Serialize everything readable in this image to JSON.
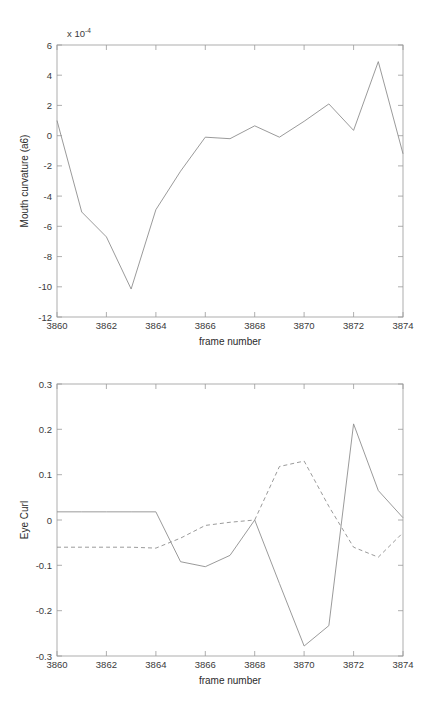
{
  "figure": {
    "background_color": "#ffffff",
    "axis_color": "#9a9a9a",
    "line_color": "#8e8e8e",
    "text_color": "#3a3a3a"
  },
  "chart_data": [
    {
      "id": "mouth-curvature",
      "type": "line",
      "title": "",
      "xlabel": "frame number",
      "ylabel": "Mouth curvature (a6)",
      "y_exponent_label": "x 10",
      "y_exponent_power": "-4",
      "y_scale_factor": 0.0001,
      "xlim": [
        3860,
        3874
      ],
      "ylim": [
        -12,
        6
      ],
      "xticks": [
        3860,
        3862,
        3864,
        3866,
        3868,
        3870,
        3872,
        3874
      ],
      "xticklabels": [
        "3860",
        "3862",
        "3864",
        "3866",
        "3868",
        "3870",
        "3872",
        "3874"
      ],
      "x_minor_ticks": [
        3861,
        3863,
        3865,
        3867,
        3869,
        3871,
        3873
      ],
      "yticks": [
        6,
        4,
        2,
        0,
        -2,
        -4,
        -6,
        -8,
        -10,
        -12
      ],
      "yticklabels": [
        "6",
        "4",
        "2",
        "0",
        "-2",
        "-4",
        "-6",
        "-8",
        "-10",
        "-12"
      ],
      "grid": false,
      "legend": false,
      "x": [
        3860,
        3861,
        3862,
        3863,
        3864,
        3865,
        3866,
        3867,
        3868,
        3869,
        3870,
        3871,
        3872,
        3873,
        3874
      ],
      "series": [
        {
          "name": "mouth curvature",
          "style": "solid",
          "values": [
            1.0,
            -5.05,
            -6.7,
            -10.15,
            -4.9,
            -2.35,
            -0.1,
            -0.2,
            0.65,
            -0.1,
            0.95,
            2.1,
            0.35,
            4.9,
            -1.2
          ]
        }
      ]
    },
    {
      "id": "eye-curl",
      "type": "line",
      "title": "",
      "xlabel": "frame number",
      "ylabel": "Eye Curl",
      "xlim": [
        3860,
        3874
      ],
      "ylim": [
        -0.3,
        0.3
      ],
      "xticks": [
        3860,
        3862,
        3864,
        3866,
        3868,
        3870,
        3872,
        3874
      ],
      "xticklabels": [
        "3860",
        "3862",
        "3864",
        "3866",
        "3868",
        "3870",
        "3872",
        "3874"
      ],
      "x_minor_ticks": [
        3861,
        3863,
        3865,
        3867,
        3869,
        3871,
        3873
      ],
      "yticks": [
        0.3,
        0.2,
        0.1,
        0,
        -0.1,
        -0.2,
        -0.3
      ],
      "yticklabels": [
        "0.3",
        "0.2",
        "0.1",
        "0",
        "-0.1",
        "-0.2",
        "-0.3"
      ],
      "grid": false,
      "legend": false,
      "x": [
        3860,
        3861,
        3862,
        3863,
        3864,
        3865,
        3866,
        3867,
        3868,
        3869,
        3870,
        3871,
        3872,
        3873,
        3874
      ],
      "series": [
        {
          "name": "eye curl solid",
          "style": "solid",
          "values": [
            0.018,
            0.018,
            0.018,
            0.018,
            0.018,
            -0.092,
            -0.103,
            -0.078,
            0.0,
            -0.14,
            -0.278,
            -0.233,
            0.212,
            0.065,
            0.005
          ]
        },
        {
          "name": "eye curl dashed",
          "style": "dashed",
          "values": [
            -0.06,
            -0.06,
            -0.06,
            -0.06,
            -0.062,
            -0.04,
            -0.012,
            -0.005,
            0.0,
            0.118,
            0.13,
            0.03,
            -0.06,
            -0.082,
            -0.028
          ]
        }
      ]
    }
  ]
}
